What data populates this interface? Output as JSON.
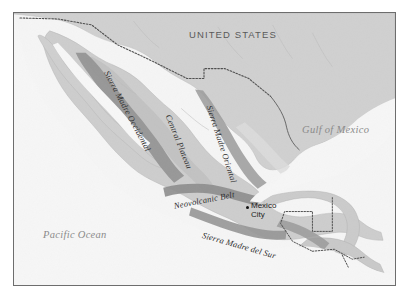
{
  "figure": {
    "kind": "physical-geography-map",
    "region": "Mexico and Central America",
    "frame_color": "#6d6d6d",
    "background_color": "#ffffff"
  },
  "palette": {
    "water": "#f5f5f5",
    "land_low": "#d2d2d2",
    "land_mid": "#c2c2c2",
    "highland": "#a8a8a8",
    "mountain": "#8f8f8f",
    "border_line": "#4a4a4a",
    "coast_line": "#9a9a9a"
  },
  "labels": {
    "countries": [
      {
        "name": "united-states",
        "text": "UNITED STATES",
        "x": 188,
        "y": 28
      }
    ],
    "water_bodies": [
      {
        "name": "pacific-ocean",
        "text": "Pacific Ocean",
        "x": 42,
        "y": 228
      },
      {
        "name": "gulf-of-mexico",
        "text": "Gulf of Mexico",
        "x": 301,
        "y": 123
      }
    ],
    "mountain_ranges": [
      {
        "name": "sierra-madre-occidental",
        "text": "Sierra Madre Occidental",
        "x": 110,
        "y": 68,
        "rotate": 62
      },
      {
        "name": "central-plateau",
        "text": "Central Plateau",
        "x": 172,
        "y": 112,
        "rotate": 68
      },
      {
        "name": "sierra-madre-oriental",
        "text": "Sierra Madre Oriental",
        "x": 213,
        "y": 103,
        "rotate": 72
      },
      {
        "name": "neovolcanic-belt",
        "text": "Neovolcanic Belt",
        "x": 172,
        "y": 200,
        "rotate": -11
      },
      {
        "name": "sierra-madre-del-sur",
        "text": "Sierra Madre del Sur",
        "x": 203,
        "y": 229,
        "rotate": 16
      }
    ],
    "cities": [
      {
        "name": "mexico-city",
        "line1": "Mexico",
        "line2": "City",
        "dot_x": 245,
        "dot_y": 205,
        "label_x": 250,
        "label_y": 200
      }
    ]
  }
}
